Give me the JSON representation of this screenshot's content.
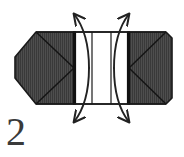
{
  "figure": {
    "kind": "folding-instruction-diagram",
    "step_label": "2",
    "caption": "",
    "colors": {
      "paper_shaded": "#4a4a4a",
      "paper_hatch_line": "#2e2e2e",
      "paper_white": "#ffffff",
      "outline": "#1a1a1a",
      "crease_heavy": "#111111",
      "arrow": "#222222",
      "number": "#3a3a3a",
      "background": "#ffffff"
    },
    "panels": [
      {
        "name": "left-shaded-panel",
        "fill": "shaded",
        "shape": "chamfered-pentagon",
        "has_diagonal_creases": true
      },
      {
        "name": "left-white-panel",
        "fill": "white",
        "shape": "rectangle",
        "has_diagonal_creases": false
      },
      {
        "name": "center-white-panel",
        "fill": "white",
        "shape": "rectangle",
        "has_diagonal_creases": false
      },
      {
        "name": "right-white-panel",
        "fill": "white",
        "shape": "rectangle",
        "has_diagonal_creases": false
      },
      {
        "name": "right-shaded-panel",
        "fill": "shaded",
        "shape": "chamfered-pentagon",
        "has_diagonal_creases": true
      }
    ],
    "creases": [
      {
        "name": "left-heavy-vertical-crease",
        "style": "heavy"
      },
      {
        "name": "right-heavy-vertical-crease",
        "style": "heavy"
      },
      {
        "name": "left-upper-diagonal",
        "style": "thin"
      },
      {
        "name": "left-lower-diagonal",
        "style": "thin"
      },
      {
        "name": "right-upper-diagonal",
        "style": "thin"
      },
      {
        "name": "right-lower-diagonal",
        "style": "thin"
      }
    ],
    "arrows": [
      {
        "name": "arrow-top-left",
        "direction": "up-left",
        "curve": "concave"
      },
      {
        "name": "arrow-top-right",
        "direction": "up-right",
        "curve": "concave"
      },
      {
        "name": "arrow-bottom-left",
        "direction": "down-left",
        "curve": "concave"
      },
      {
        "name": "arrow-bottom-right",
        "direction": "down-right",
        "curve": "concave"
      }
    ]
  }
}
